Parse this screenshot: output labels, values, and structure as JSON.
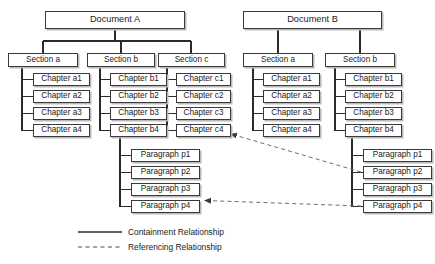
{
  "diagram": {
    "type": "tree-hierarchy-with-references",
    "canvas": {
      "width": 435,
      "height": 264
    },
    "colors": {
      "node_border": "#3a3a3a",
      "node_fill": "#ffffff",
      "node_shadow": "#b9b9b9",
      "containment_line": "#2b2b2b",
      "referencing_line": "#6e6e6e",
      "text": "#1a1a1a"
    },
    "documents": [
      {
        "id": "docA",
        "label": "Document A",
        "box": {
          "x": 45,
          "y": 11,
          "w": 140,
          "h": 18
        },
        "sections": [
          {
            "id": "docA-secA",
            "label": "Section a",
            "box": {
              "x": 8,
              "y": 53,
              "w": 70,
              "h": 14
            },
            "chapters": [
              {
                "id": "docA-secA-ch1",
                "label": "Chapter a1",
                "box": {
                  "x": 33,
                  "y": 73,
                  "w": 57,
                  "h": 13
                }
              },
              {
                "id": "docA-secA-ch2",
                "label": "Chapter a2",
                "box": {
                  "x": 33,
                  "y": 90,
                  "w": 57,
                  "h": 13
                }
              },
              {
                "id": "docA-secA-ch3",
                "label": "Chapter a3",
                "box": {
                  "x": 33,
                  "y": 107,
                  "w": 57,
                  "h": 13
                }
              },
              {
                "id": "docA-secA-ch4",
                "label": "Chapter a4",
                "box": {
                  "x": 33,
                  "y": 124,
                  "w": 57,
                  "h": 13
                }
              }
            ]
          },
          {
            "id": "docA-secB",
            "label": "Section b",
            "box": {
              "x": 87,
              "y": 53,
              "w": 68,
              "h": 14
            },
            "chapters": [
              {
                "id": "docA-secB-ch1",
                "label": "Chapter b1",
                "box": {
                  "x": 110,
                  "y": 73,
                  "w": 57,
                  "h": 13
                }
              },
              {
                "id": "docA-secB-ch2",
                "label": "Chapter b2",
                "box": {
                  "x": 110,
                  "y": 90,
                  "w": 57,
                  "h": 13
                }
              },
              {
                "id": "docA-secB-ch3",
                "label": "Chapter b3",
                "box": {
                  "x": 110,
                  "y": 107,
                  "w": 57,
                  "h": 13
                }
              },
              {
                "id": "docA-secB-ch4",
                "label": "Chapter b4",
                "box": {
                  "x": 110,
                  "y": 124,
                  "w": 57,
                  "h": 13
                }
              }
            ]
          },
          {
            "id": "docA-secC",
            "label": "Section c",
            "box": {
              "x": 158,
              "y": 53,
              "w": 67,
              "h": 14
            },
            "chapters": [
              {
                "id": "docA-secC-ch1",
                "label": "Chapter c1",
                "box": {
                  "x": 176,
                  "y": 73,
                  "w": 55,
                  "h": 13
                }
              },
              {
                "id": "docA-secC-ch2",
                "label": "Chapter c2",
                "box": {
                  "x": 176,
                  "y": 90,
                  "w": 55,
                  "h": 13
                }
              },
              {
                "id": "docA-secC-ch3",
                "label": "Chapter c3",
                "box": {
                  "x": 176,
                  "y": 107,
                  "w": 55,
                  "h": 13
                }
              },
              {
                "id": "docA-secC-ch4",
                "label": "Chapter c4",
                "box": {
                  "x": 176,
                  "y": 124,
                  "w": 55,
                  "h": 13
                }
              }
            ]
          }
        ],
        "paragraphs": [
          {
            "id": "docA-p1",
            "label": "Paragraph p1",
            "box": {
              "x": 131,
              "y": 149,
              "w": 69,
              "h": 13
            }
          },
          {
            "id": "docA-p2",
            "label": "Paragraph p2",
            "box": {
              "x": 131,
              "y": 166,
              "w": 69,
              "h": 13
            }
          },
          {
            "id": "docA-p3",
            "label": "Paragraph p3",
            "box": {
              "x": 131,
              "y": 183,
              "w": 69,
              "h": 13
            }
          },
          {
            "id": "docA-p4",
            "label": "Paragraph p4",
            "box": {
              "x": 131,
              "y": 200,
              "w": 69,
              "h": 13
            }
          }
        ]
      },
      {
        "id": "docB",
        "label": "Document B",
        "box": {
          "x": 243,
          "y": 11,
          "w": 139,
          "h": 18
        },
        "sections": [
          {
            "id": "docB-secA",
            "label": "Section a",
            "box": {
              "x": 243,
              "y": 53,
              "w": 70,
              "h": 14
            },
            "chapters": [
              {
                "id": "docB-secA-ch1",
                "label": "Chapter a1",
                "box": {
                  "x": 263,
                  "y": 73,
                  "w": 57,
                  "h": 13
                }
              },
              {
                "id": "docB-secA-ch2",
                "label": "Chapter a2",
                "box": {
                  "x": 263,
                  "y": 90,
                  "w": 57,
                  "h": 13
                }
              },
              {
                "id": "docB-secA-ch3",
                "label": "Chapter a3",
                "box": {
                  "x": 263,
                  "y": 107,
                  "w": 57,
                  "h": 13
                }
              },
              {
                "id": "docB-secA-ch4",
                "label": "Chapter a4",
                "box": {
                  "x": 263,
                  "y": 124,
                  "w": 57,
                  "h": 13
                }
              }
            ]
          },
          {
            "id": "docB-secB",
            "label": "Section b",
            "box": {
              "x": 325,
              "y": 53,
              "w": 70,
              "h": 14
            },
            "chapters": [
              {
                "id": "docB-secB-ch1",
                "label": "Chapter b1",
                "box": {
                  "x": 345,
                  "y": 73,
                  "w": 57,
                  "h": 13
                }
              },
              {
                "id": "docB-secB-ch2",
                "label": "Chapter b2",
                "box": {
                  "x": 345,
                  "y": 90,
                  "w": 57,
                  "h": 13
                }
              },
              {
                "id": "docB-secB-ch3",
                "label": "Chapter b3",
                "box": {
                  "x": 345,
                  "y": 107,
                  "w": 57,
                  "h": 13
                }
              },
              {
                "id": "docB-secB-ch4",
                "label": "Chapter b4",
                "box": {
                  "x": 345,
                  "y": 124,
                  "w": 57,
                  "h": 13
                }
              }
            ]
          }
        ],
        "paragraphs": [
          {
            "id": "docB-p1",
            "label": "Paragraph p1",
            "box": {
              "x": 363,
              "y": 149,
              "w": 69,
              "h": 13
            }
          },
          {
            "id": "docB-p2",
            "label": "Paragraph p2",
            "box": {
              "x": 363,
              "y": 166,
              "w": 69,
              "h": 13
            }
          },
          {
            "id": "docB-p3",
            "label": "Paragraph p3",
            "box": {
              "x": 363,
              "y": 183,
              "w": 69,
              "h": 13
            }
          },
          {
            "id": "docB-p4",
            "label": "Paragraph p4",
            "box": {
              "x": 363,
              "y": 200,
              "w": 69,
              "h": 13
            }
          }
        ]
      }
    ],
    "references": [
      {
        "id": "ref-p2-to-c4",
        "from": "docB-p2",
        "to": "docA-secC-ch4",
        "style": "dashed",
        "arrow": "target"
      },
      {
        "id": "ref-p4-to-p4",
        "from": "docB-p4",
        "to": "docA-p4",
        "style": "dashed",
        "arrow": "target"
      }
    ],
    "legend": {
      "containment": {
        "label": "Containment Relationship",
        "style": "solid"
      },
      "referencing": {
        "label": "Referencing Relationship",
        "style": "dashed"
      }
    }
  }
}
